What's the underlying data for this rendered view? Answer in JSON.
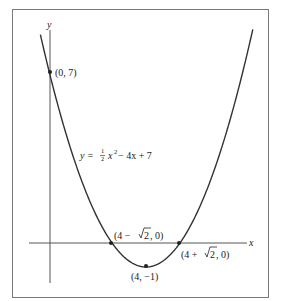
{
  "chart_data": {
    "type": "line",
    "title": "",
    "xlabel": "x",
    "ylabel": "y",
    "equation": "y = ½ x² − 4x + 7",
    "equation_parts": {
      "lhs": "y = ",
      "num": "1",
      "den": "2",
      "rhs_a": "x",
      "exp": "2",
      "rhs_b": " − 4x + 7"
    },
    "series": [
      {
        "name": "y = 1/2 x^2 - 4x + 7",
        "function": "0.5*x*x - 4*x + 7",
        "x_range": [
          -0.4,
          8.45
        ]
      }
    ],
    "points": [
      {
        "label": "(0, 7)",
        "x": 0,
        "y": 7
      },
      {
        "label": "(4, −1)",
        "x": 4,
        "y": -1
      },
      {
        "label": "(4 − √2, 0)",
        "x": 2.586,
        "y": 0
      },
      {
        "label": "(4 + √2, 0)",
        "x": 5.414,
        "y": 0
      }
    ],
    "grid": false,
    "legend": "none",
    "xlim": [
      -0.9,
      8.2
    ],
    "ylim": [
      -1.5,
      8.7
    ]
  },
  "labels": {
    "y_axis": "y",
    "x_axis": "x",
    "p_intercept": "(0, 7)",
    "p_vertex": "(4, −1)",
    "p_root_left_pre": "(4 − ",
    "p_root_left_rad": "2",
    "p_root_left_post": ", 0)",
    "p_root_right_pre": "(4 + ",
    "p_root_right_rad": "2",
    "p_root_right_post": ", 0)"
  },
  "colors": {
    "curve": "#333333",
    "axis": "#555555",
    "frame": "#777777",
    "text": "#222222"
  }
}
